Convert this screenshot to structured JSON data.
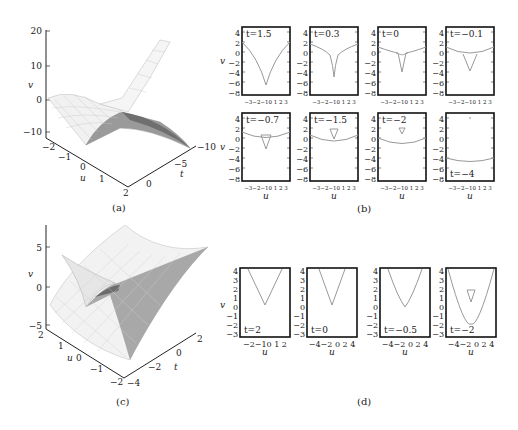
{
  "figure": {
    "panels": {
      "a": {
        "caption": "(a)",
        "axes": {
          "v_label": "v",
          "u_label": "u",
          "t_label": "t",
          "v_ticks": [
            "20",
            "10",
            "0",
            "−10"
          ],
          "u_ticks": [
            "−2",
            "−1",
            "0",
            "1",
            "2"
          ],
          "t_ticks": [
            "0",
            "−5",
            "−10"
          ]
        }
      },
      "b": {
        "caption": "(b)",
        "v_label": "v",
        "u_label": "u",
        "y_ticks": [
          "4",
          "2",
          "0",
          "−2",
          "−4",
          "−6",
          "−8"
        ],
        "x_ticks": "−3−2−10  1  2  3",
        "subplots": [
          {
            "label": "t=1.5"
          },
          {
            "label": "t=0.3"
          },
          {
            "label": "t=0"
          },
          {
            "label": "t=−0.1"
          },
          {
            "label": "t=−0.7"
          },
          {
            "label": "t=−1.5"
          },
          {
            "label": "t=−2"
          },
          {
            "label": "t=−4"
          }
        ]
      },
      "c": {
        "caption": "(c)",
        "axes": {
          "v_label": "v",
          "u_label": "u",
          "t_label": "t",
          "v_ticks": [
            "5",
            "0",
            "−5"
          ],
          "u_ticks": [
            "2",
            "1",
            "0",
            "−1",
            "−2"
          ],
          "t_ticks": [
            "−4",
            "−2",
            "0",
            "2"
          ]
        }
      },
      "d": {
        "caption": "(d)",
        "v_label": "v",
        "u_label": "u",
        "y_ticks": [
          "4",
          "3",
          "2",
          "1",
          "0",
          "−1",
          "−2",
          "−3"
        ],
        "subplots": [
          {
            "label": "t=2",
            "x_ticks": "−2−10 1 2"
          },
          {
            "label": "t=0",
            "x_ticks": "−4−2 0 2 4"
          },
          {
            "label": "t=−0.5",
            "x_ticks": "−4−2 0 2 4"
          },
          {
            "label": "t=−2",
            "x_ticks": "−4−2 0 2 4"
          }
        ]
      }
    }
  }
}
